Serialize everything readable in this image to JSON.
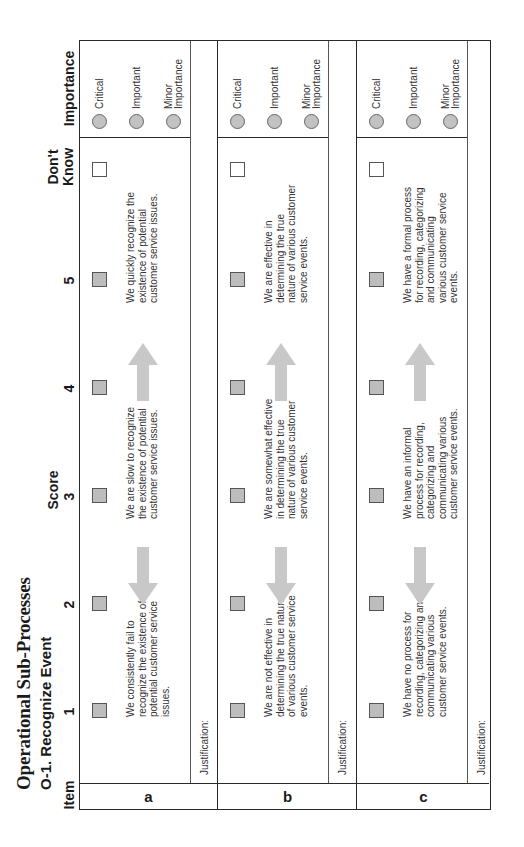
{
  "page": {
    "title": "Operational Sub-Processes",
    "subtitle": "O-1.  Recognize Event"
  },
  "headers": {
    "item": "Item",
    "score_label": "Score",
    "scores": [
      "1",
      "2",
      "3",
      "4",
      "5"
    ],
    "dont_know_line1": "Don't",
    "dont_know_line2": "Know",
    "importance": "Importance"
  },
  "importance_options": {
    "critical": "Critical",
    "important": "Important",
    "minor_line1": "Minor",
    "minor_line2": "Importance"
  },
  "justification_label": "Justification:",
  "items": [
    {
      "label": "a",
      "low": "We consistently fail to recognize the existence of potential customer service issues.",
      "mid": "We are slow to recognize the existence of potential customer service issues.",
      "high": "We quickly recognize the existence of potential customer service issues."
    },
    {
      "label": "b",
      "low": "We are not effective in determining the true nature of various customer service events.",
      "mid": "We are somewhat effective in determining the true nature of various customer service events.",
      "high": "We are effective in determining the true nature of various customer service events."
    },
    {
      "label": "c",
      "low": "We have no process for recording, categorizing and communicating various customer service events.",
      "mid": "We have an informal process for recording, categorizing and communicating various customer service events.",
      "high": "We have a formal process for recording, categorizing and communicating various customer service events."
    }
  ],
  "colors": {
    "checkbox_fill": "#bdbdbd",
    "radio_fill": "#c2c2c2",
    "arrow_fill": "#c8c8c8",
    "border": "#2a2a2a"
  }
}
